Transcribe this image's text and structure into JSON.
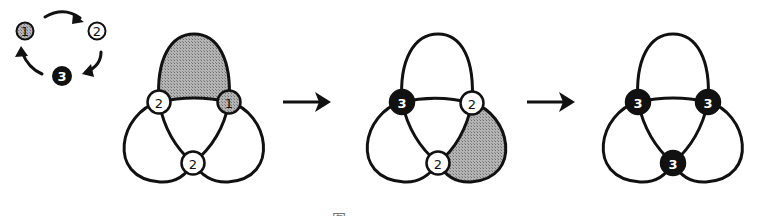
{
  "figure": {
    "caption": "图 x",
    "colors": {
      "stroke": "#111111",
      "state1_fill": "#9a9a9a",
      "state2_fill": "#ffffff",
      "state3_fill": "#111111",
      "shaded_region": "#a8a8a8"
    }
  },
  "legend": {
    "title": "state cycle",
    "nodes": [
      {
        "id": "legend-1",
        "label": "1",
        "state": 1
      },
      {
        "id": "legend-2",
        "label": "2",
        "state": 2
      },
      {
        "id": "legend-3",
        "label": "3",
        "state": 3
      }
    ],
    "cycle": [
      "1 → 2",
      "2 → 3",
      "3 → 1"
    ]
  },
  "diagrams": [
    {
      "id": "step-1",
      "shaded_lobe": "top",
      "nodes": {
        "left": "2",
        "right": "1",
        "bottom": "2"
      }
    },
    {
      "id": "step-2",
      "shaded_lobe": "right",
      "nodes": {
        "left": "3",
        "right": "2",
        "bottom": "2"
      }
    },
    {
      "id": "step-3",
      "shaded_lobe": "none",
      "nodes": {
        "left": "3",
        "right": "3",
        "bottom": "3"
      }
    }
  ],
  "arrows": [
    {
      "id": "arrow-1-to-2",
      "glyph": "→"
    },
    {
      "id": "arrow-2-to-3",
      "glyph": "→"
    }
  ]
}
